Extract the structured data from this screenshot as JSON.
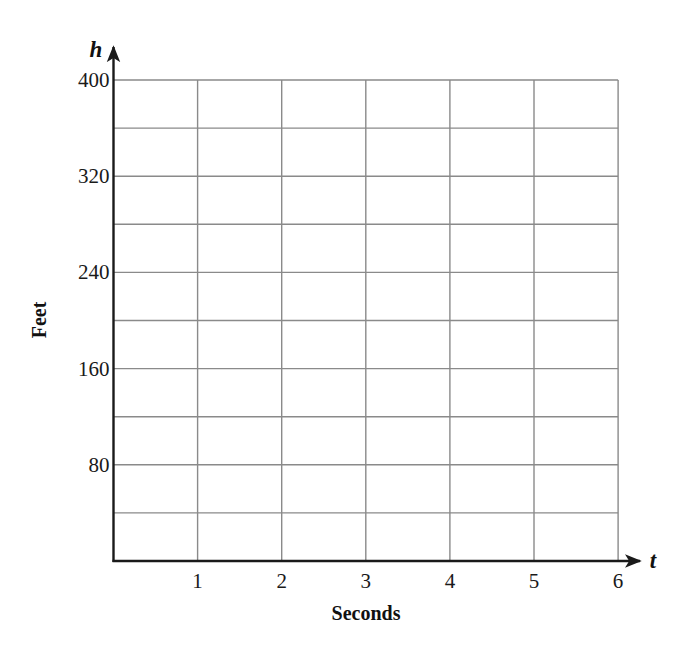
{
  "chart_data": {
    "type": "line",
    "title": "",
    "xlabel": "Seconds",
    "ylabel": "Feet",
    "x_var": "t",
    "y_var": "h",
    "xlim": [
      0,
      6
    ],
    "ylim": [
      0,
      400
    ],
    "x_ticks": [
      1,
      2,
      3,
      4,
      5,
      6
    ],
    "x_tick_labels": [
      "1",
      "2",
      "3",
      "4",
      "5",
      "6"
    ],
    "y_ticks": [
      80,
      160,
      240,
      320,
      400
    ],
    "y_tick_labels": [
      "80",
      "160",
      "240",
      "320",
      "400"
    ],
    "x_grid_step": 1,
    "y_grid_step": 40,
    "grid": true,
    "legend": null,
    "series": []
  },
  "layout": {
    "origin_px": [
      113.5,
      561
    ],
    "x_unit_px": 84.1,
    "y_unit_px": 1.2025,
    "grid_color": "#8a8a8a",
    "axis_color": "#1a1a1a"
  }
}
